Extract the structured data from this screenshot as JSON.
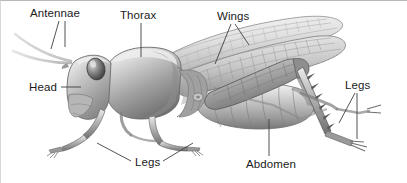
{
  "figure": {
    "style": "grayscale-scientific-illustration",
    "width": 407,
    "height": 183,
    "background_color": "#ffffff",
    "label_color": "#1a1a1a",
    "leader_line_color": "#404040"
  },
  "labels": [
    {
      "id": "antennae",
      "text": "Antennae",
      "x": 29,
      "y": 6,
      "leaders": 2
    },
    {
      "id": "thorax",
      "text": "Thorax",
      "x": 119,
      "y": 8,
      "leaders": 1
    },
    {
      "id": "wings",
      "text": "Wings",
      "x": 216,
      "y": 9,
      "leaders": 2
    },
    {
      "id": "head",
      "text": "Head",
      "x": 28,
      "y": 80,
      "leaders": 1
    },
    {
      "id": "legs-right",
      "text": "Legs",
      "x": 344,
      "y": 78,
      "leaders": 2
    },
    {
      "id": "legs-bottom",
      "text": "Legs",
      "x": 134,
      "y": 155,
      "leaders": 2
    },
    {
      "id": "abdomen",
      "text": "Abdomen",
      "x": 245,
      "y": 157,
      "leaders": 1
    }
  ],
  "anatomy_parts": [
    "antennae",
    "head",
    "compound-eye",
    "thorax",
    "pronotum",
    "forewing",
    "hindwing",
    "abdomen",
    "foreleg",
    "midleg",
    "hindleg",
    "tarsus"
  ]
}
